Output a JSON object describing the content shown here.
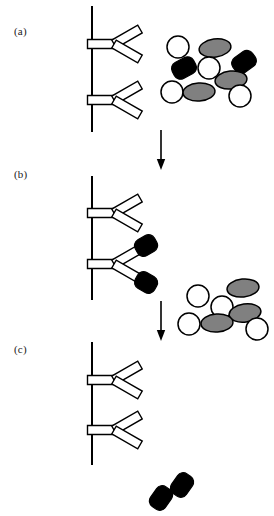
{
  "figure": {
    "width": 274,
    "height": 516,
    "background_color": "#ffffff",
    "stroke_color": "#000000"
  },
  "colors": {
    "outline": "#000000",
    "white_particle_fill": "#ffffff",
    "gray_particle_fill": "#808080",
    "black_particle_fill": "#000000",
    "label_text": "#1a1a1a"
  },
  "panels": [
    {
      "id": "a",
      "label": "(a)",
      "label_x": 14,
      "label_y": 26,
      "surface": {
        "x": 92,
        "y1": 6,
        "y2": 132
      },
      "antibodies": [
        {
          "name": "antibody-a-top",
          "x": 92,
          "y": 44,
          "bound": []
        },
        {
          "name": "antibody-a-bottom",
          "x": 92,
          "y": 100,
          "bound": []
        }
      ],
      "particles": [
        {
          "type": "white-circle",
          "cx": 178,
          "cy": 47,
          "rx": 11,
          "ry": 11,
          "rot": 0
        },
        {
          "type": "gray-ellipse",
          "cx": 215,
          "cy": 48,
          "rx": 16,
          "ry": 9,
          "rot": -8
        },
        {
          "type": "black-capsule",
          "cx": 244,
          "cy": 62,
          "rx": 12,
          "ry": 9,
          "rot": -35
        },
        {
          "type": "black-capsule",
          "cx": 184,
          "cy": 68,
          "rx": 12,
          "ry": 9,
          "rot": -28
        },
        {
          "type": "white-circle",
          "cx": 209,
          "cy": 68,
          "rx": 11,
          "ry": 11,
          "rot": 0
        },
        {
          "type": "gray-ellipse",
          "cx": 231,
          "cy": 80,
          "rx": 16,
          "ry": 9,
          "rot": -6
        },
        {
          "type": "white-circle",
          "cx": 172,
          "cy": 92,
          "rx": 11,
          "ry": 11,
          "rot": 0
        },
        {
          "type": "gray-ellipse",
          "cx": 199,
          "cy": 92,
          "rx": 16,
          "ry": 9,
          "rot": -4
        },
        {
          "type": "white-circle",
          "cx": 240,
          "cy": 96,
          "rx": 11,
          "ry": 11,
          "rot": 0
        }
      ]
    },
    {
      "id": "b",
      "label": "(b)",
      "label_x": 14,
      "label_y": 169,
      "surface": {
        "x": 92,
        "y1": 176,
        "y2": 300
      },
      "antibodies": [
        {
          "name": "antibody-b-top",
          "x": 92,
          "y": 213,
          "bound": []
        },
        {
          "name": "antibody-b-bottom",
          "x": 92,
          "y": 264,
          "bound": [
            "black-capsule",
            "black-capsule"
          ]
        }
      ],
      "particles": [
        {
          "type": "white-circle",
          "cx": 198,
          "cy": 296,
          "rx": 11,
          "ry": 11,
          "rot": 0
        },
        {
          "type": "gray-ellipse",
          "cx": 243,
          "cy": 288,
          "rx": 16,
          "ry": 9,
          "rot": -6
        },
        {
          "type": "white-circle",
          "cx": 222,
          "cy": 307,
          "rx": 11,
          "ry": 11,
          "rot": 0
        },
        {
          "type": "gray-ellipse",
          "cx": 245,
          "cy": 313,
          "rx": 16,
          "ry": 9,
          "rot": -8
        },
        {
          "type": "white-circle",
          "cx": 189,
          "cy": 324,
          "rx": 11,
          "ry": 11,
          "rot": 0
        },
        {
          "type": "gray-ellipse",
          "cx": 217,
          "cy": 323,
          "rx": 16,
          "ry": 9,
          "rot": -4
        },
        {
          "type": "white-circle",
          "cx": 257,
          "cy": 329,
          "rx": 11,
          "ry": 11,
          "rot": 0
        }
      ]
    },
    {
      "id": "c",
      "label": "(c)",
      "label_x": 14,
      "label_y": 344,
      "surface": {
        "x": 92,
        "y1": 342,
        "y2": 465
      },
      "antibodies": [
        {
          "name": "antibody-c-top",
          "x": 92,
          "y": 380,
          "bound": []
        },
        {
          "name": "antibody-c-bottom",
          "x": 92,
          "y": 430,
          "bound": []
        }
      ],
      "particles": [
        {
          "type": "black-capsule",
          "cx": 182,
          "cy": 485,
          "rx": 12,
          "ry": 9,
          "rot": -55
        },
        {
          "type": "black-capsule",
          "cx": 161,
          "cy": 498,
          "rx": 12,
          "ry": 9,
          "rot": -55
        }
      ]
    }
  ],
  "arrows": [
    {
      "name": "arrow-a-to-b",
      "x": 161,
      "y1": 130,
      "y2": 170
    },
    {
      "name": "arrow-b-to-c",
      "x": 161,
      "y1": 301,
      "y2": 341
    }
  ],
  "legend_semantics": {
    "white-circle": "unlabeled analyte particle",
    "gray-ellipse": "gray particle",
    "black-capsule": "labeled tracer particle",
    "antibody": "surface-immobilized antibody (Y shape)",
    "surface": "solid support vertical line"
  }
}
